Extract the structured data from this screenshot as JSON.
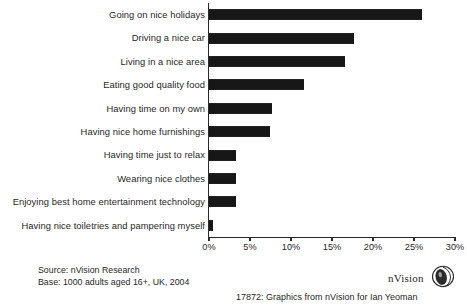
{
  "chart_data": {
    "type": "bar",
    "orientation": "horizontal",
    "title": "",
    "xlabel": "",
    "ylabel": "",
    "xlim": [
      0,
      30
    ],
    "grid": false,
    "legend": null,
    "value_suffix": "%",
    "categories": [
      "Going on nice holidays",
      "Driving a nice car",
      "Living in a nice area",
      "Eating good quality food",
      "Having time on my own",
      "Having nice home furnishings",
      "Having time just to relax",
      "Wearing nice clothes",
      "Enjoying best home entertainment technology",
      "Having nice toiletries and pampering myself"
    ],
    "values": [
      26,
      17.7,
      16.6,
      11.6,
      7.7,
      7.4,
      3.3,
      3.3,
      3.3,
      0.5
    ],
    "xticks": [
      0,
      5,
      10,
      15,
      20,
      25,
      30
    ],
    "xtick_labels": [
      "0%",
      "5%",
      "10%",
      "15%",
      "20%",
      "25%",
      "30%"
    ],
    "bar_color": "#171717"
  },
  "footer": {
    "source": "Source: nVision Research",
    "base": "Base: 1000 adults aged 16+, UK, 2004",
    "credit": "17872: Graphics from  nVision  for Ian Yeoman"
  },
  "logo": {
    "wordmark": "nVision",
    "mark_name": "nvision-egg-icon"
  }
}
